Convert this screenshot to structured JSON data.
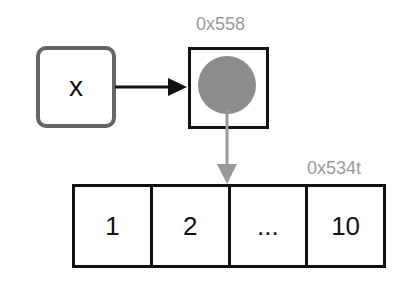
{
  "variable": {
    "name": "x"
  },
  "pointer": {
    "address": "0x558",
    "dot_color": "#8c8c8c"
  },
  "array": {
    "address": "0x534t",
    "cells": [
      "1",
      "2",
      "...",
      "10"
    ]
  },
  "colors": {
    "box_border": "#666666",
    "arrow_black": "#111111",
    "arrow_gray": "#999999",
    "label_gray": "#999999"
  }
}
